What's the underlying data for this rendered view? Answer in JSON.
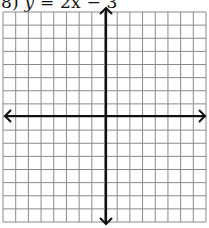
{
  "problem": {
    "number": "8)",
    "equation_lhs": "y",
    "equals": "=",
    "equation_rhs_term1": "2x",
    "minus": "−",
    "equation_rhs_term2": "3"
  },
  "grid": {
    "columns": 16,
    "rows": 16,
    "left": 3,
    "top": 12,
    "right": 206,
    "bottom": 222,
    "x_axis_y": 116,
    "y_axis_x": 106,
    "grid_line_color": "#8a8a8a",
    "axis_color": "#111111",
    "background": "#ffffff"
  },
  "axes": {
    "x_axis_arrows": [
      "left",
      "right"
    ],
    "y_axis_arrows": [
      "up",
      "down"
    ]
  }
}
